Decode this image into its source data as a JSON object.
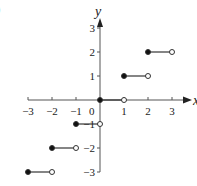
{
  "panel_label": ")",
  "chart_data": {
    "type": "line",
    "title": "",
    "function": "floor(x)",
    "xlabel": "x",
    "ylabel": "y",
    "xlim": [
      -3,
      3
    ],
    "ylim": [
      -3,
      3
    ],
    "x_ticks": [
      -3,
      -2,
      -1,
      1,
      2,
      3
    ],
    "x_tick_labels": [
      "−3",
      "−2",
      "−1",
      "1",
      "2",
      "3"
    ],
    "y_ticks": [
      -3,
      -2,
      -1,
      1,
      2,
      3
    ],
    "y_tick_labels": [
      "−3",
      "−2",
      "−1",
      "1",
      "2",
      "3"
    ],
    "origin_label": "0",
    "grid": false,
    "segments": [
      {
        "x_start": -3,
        "x_end": -2,
        "y": -3,
        "start_closed": true,
        "end_closed": false
      },
      {
        "x_start": -2,
        "x_end": -1,
        "y": -2,
        "start_closed": true,
        "end_closed": false
      },
      {
        "x_start": -1,
        "x_end": 0,
        "y": -1,
        "start_closed": true,
        "end_closed": false
      },
      {
        "x_start": 0,
        "x_end": 1,
        "y": 0,
        "start_closed": true,
        "end_closed": false
      },
      {
        "x_start": 1,
        "x_end": 2,
        "y": 1,
        "start_closed": true,
        "end_closed": false
      },
      {
        "x_start": 2,
        "x_end": 3,
        "y": 2,
        "start_closed": true,
        "end_closed": false
      }
    ]
  }
}
